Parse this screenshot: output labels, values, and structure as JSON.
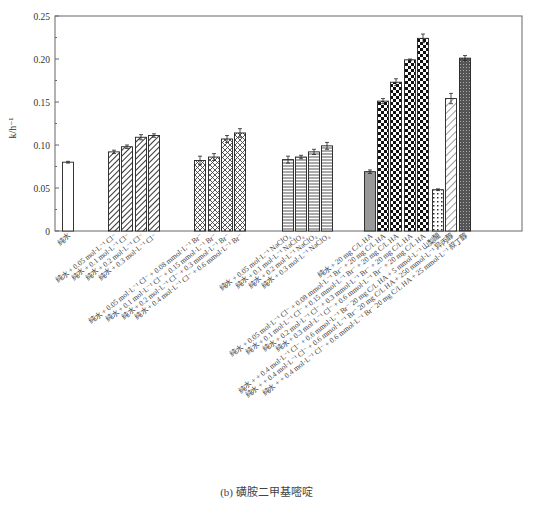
{
  "chart_data": {
    "type": "bar",
    "title": "",
    "caption": "(b) 磺胺二甲基嘧啶",
    "xlabel": "",
    "ylabel": "k/h⁻¹",
    "ylim": [
      0,
      0.25
    ],
    "yticks": [
      "0",
      "0.05",
      "0.10",
      "0.15",
      "0.20",
      "0.25"
    ],
    "grid": false,
    "legend": "none",
    "categories": [
      "纯水",
      "纯水 + 0.05 mol·L⁻¹ Cl⁻",
      "纯水 + 0.1 mol·L⁻¹ Cl⁻",
      "纯水 + 0.2 mol·L⁻¹ Cl⁻",
      "纯水 + 0.3 mol·L⁻¹ Cl⁻",
      "纯水 + 0.05 mol·L⁻¹ Cl⁻ + 0.08 mmol·L⁻¹ Br⁻",
      "纯水 + 0.1 mol·L⁻¹ Cl⁻ + 0.15 mmol·L⁻¹ Br⁻",
      "纯水 + 0.2 mol·L⁻¹ Cl⁻ + 0.3 mmol·L⁻¹ Br⁻",
      "纯水 + 0.4 mol·L⁻¹ Cl⁻ + 0.6 mmol·L⁻¹ Br⁻",
      "纯水 + 0.05 mol·L⁻¹ NaClO₄",
      "纯水 + 0.1 mol·L⁻¹ NaClO₄",
      "纯水 + 0.2 mol·L⁻¹ NaClO₄",
      "纯水 + 0.3 mol·L⁻¹ NaClO₄",
      "纯水 + 20 mg C/L HA",
      "纯水 + 0.05 mol·L⁻¹ Cl⁻ + 0.08 mmol·L⁻¹ Br⁻ + 20 mg C/L HA",
      "纯水 + 0.1 mol·L⁻¹ Cl⁻ + 0.15 mmol·L⁻¹ Br⁻ + 20 mg C/L HA",
      "纯水 + 0.2 mol·L⁻¹ Cl⁻ + 0.3 mmol·L⁻¹ Br⁻ + 20 mg C/L HA",
      "纯水 + 0.3 mol·L⁻¹ Cl⁻ + 0.6 mmol·L⁻¹ Br⁻ + 20 mg C/L HA",
      "纯水 + + 0.4 mol·L⁻¹ Cl⁻ + 0.6 mmol·L⁻¹ Br⁻ 20 mg C/L HA + 5 mmol·L⁻¹ 山梨酸",
      "纯水 + + 0.4 mol·L⁻¹ Cl⁻ + 0.6 mmol·L⁻¹ Br⁻ 20 mg C/L HA + 250 mmol·L⁻¹ 异丙醇",
      "纯水 + + 0.4 mol·L⁻¹ Cl⁻ + 0.6 mmol·L⁻¹ Br⁻ 20 mg C/L HA + 25 mmol·L⁻¹ 叔丁醇"
    ],
    "values": [
      0.08,
      0.092,
      0.098,
      0.109,
      0.111,
      0.082,
      0.086,
      0.107,
      0.114,
      0.083,
      0.086,
      0.092,
      0.099,
      0.069,
      0.151,
      0.173,
      0.199,
      0.224,
      0.048,
      0.154,
      0.201
    ],
    "errors": [
      0.001,
      0.002,
      0.002,
      0.003,
      0.002,
      0.005,
      0.004,
      0.004,
      0.005,
      0.004,
      0.002,
      0.003,
      0.004,
      0.002,
      0.003,
      0.004,
      0.001,
      0.005,
      0.001,
      0.006,
      0.003
    ],
    "bar_x": [
      68,
      114,
      127,
      141,
      154,
      200,
      214,
      227,
      240,
      288,
      301,
      314,
      327,
      370,
      383,
      396,
      410,
      423,
      438,
      451,
      465
    ],
    "patterns": [
      "white",
      "diag",
      "diag",
      "diag",
      "diag",
      "cross",
      "cross",
      "cross",
      "cross",
      "hline",
      "hline",
      "hline",
      "hline",
      "gray",
      "checker",
      "checker",
      "checker",
      "checker",
      "dots",
      "diag-light",
      "dark-dots"
    ]
  }
}
